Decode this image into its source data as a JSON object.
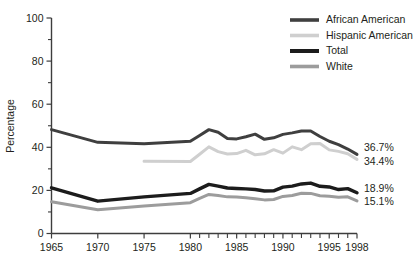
{
  "chart_data": {
    "type": "line",
    "title": "",
    "subtitle": "",
    "xlabel": "",
    "ylabel": "Percentage",
    "xlim": [
      1965,
      1998
    ],
    "ylim": [
      0,
      100
    ],
    "grid": false,
    "legend_position": "top-right",
    "y_ticks": [
      0,
      20,
      40,
      60,
      80,
      100
    ],
    "y_ticks_minor": [
      10,
      30,
      50,
      70,
      90
    ],
    "x_ticks": [
      1965,
      1970,
      1975,
      1980,
      1985,
      1990,
      1995,
      1998
    ],
    "x_ticks_minor": [
      1981,
      1982,
      1983,
      1984,
      1986,
      1987,
      1988,
      1989,
      1991,
      1992,
      1993,
      1994,
      1996,
      1997
    ],
    "x_tick_labels": [
      "1965",
      "1970",
      "1975",
      "1980",
      "1985",
      "1990",
      "1995",
      "1998"
    ],
    "y_tick_labels": [
      "0",
      "20",
      "40",
      "60",
      "80",
      "100"
    ],
    "series": [
      {
        "name": "African American",
        "color": "#3f3f3f",
        "width": 3.0,
        "end_label": "36.7%",
        "x": [
          1965,
          1970,
          1975,
          1980,
          1981,
          1982,
          1983,
          1984,
          1985,
          1986,
          1987,
          1988,
          1989,
          1990,
          1991,
          1992,
          1993,
          1994,
          1995,
          1996,
          1997,
          1998
        ],
        "values": [
          48.2,
          42.3,
          41.7,
          42.8,
          45.5,
          48.2,
          47.0,
          44.1,
          43.9,
          44.9,
          46.1,
          43.7,
          44.4,
          46.0,
          46.7,
          47.6,
          47.6,
          45.0,
          42.8,
          41.2,
          39.2,
          36.7
        ]
      },
      {
        "name": "Hispanic American",
        "color": "#cfcfcf",
        "width": 3.0,
        "end_label": "34.4%",
        "x": [
          1975,
          1980,
          1981,
          1982,
          1983,
          1984,
          1985,
          1986,
          1987,
          1988,
          1989,
          1990,
          1991,
          1992,
          1993,
          1994,
          1995,
          1996,
          1997,
          1998
        ],
        "values": [
          33.5,
          33.4,
          36.8,
          40.2,
          38.0,
          36.9,
          37.1,
          38.6,
          36.5,
          37.0,
          38.9,
          37.3,
          40.2,
          38.9,
          41.6,
          41.8,
          38.8,
          38.1,
          37.0,
          34.4
        ]
      },
      {
        "name": "Total",
        "color": "#1c1c1c",
        "width": 3.4,
        "end_label": "18.9%",
        "x": [
          1965,
          1970,
          1975,
          1980,
          1981,
          1982,
          1983,
          1984,
          1985,
          1986,
          1987,
          1988,
          1989,
          1990,
          1991,
          1992,
          1993,
          1994,
          1995,
          1996,
          1997,
          1998
        ],
        "values": [
          21.2,
          15.0,
          17.0,
          18.6,
          20.7,
          22.8,
          22.0,
          21.1,
          20.9,
          20.7,
          20.4,
          19.7,
          19.8,
          21.5,
          22.0,
          23.0,
          23.4,
          21.9,
          21.6,
          20.4,
          20.8,
          18.9
        ]
      },
      {
        "name": "White",
        "color": "#9c9c9c",
        "width": 3.0,
        "end_label": "15.1%",
        "x": [
          1965,
          1970,
          1975,
          1980,
          1981,
          1982,
          1983,
          1984,
          1985,
          1986,
          1987,
          1988,
          1989,
          1990,
          1991,
          1992,
          1993,
          1994,
          1995,
          1996,
          1997,
          1998
        ],
        "values": [
          14.7,
          11.0,
          12.8,
          14.3,
          16.3,
          18.1,
          17.6,
          17.0,
          16.9,
          16.6,
          16.1,
          15.6,
          15.8,
          17.2,
          17.6,
          18.7,
          18.6,
          17.5,
          17.3,
          16.8,
          17.0,
          15.1
        ]
      }
    ]
  },
  "legend": {
    "items": [
      {
        "label": "African American"
      },
      {
        "label": "Hispanic American"
      },
      {
        "label": "Total"
      },
      {
        "label": "White"
      }
    ]
  }
}
